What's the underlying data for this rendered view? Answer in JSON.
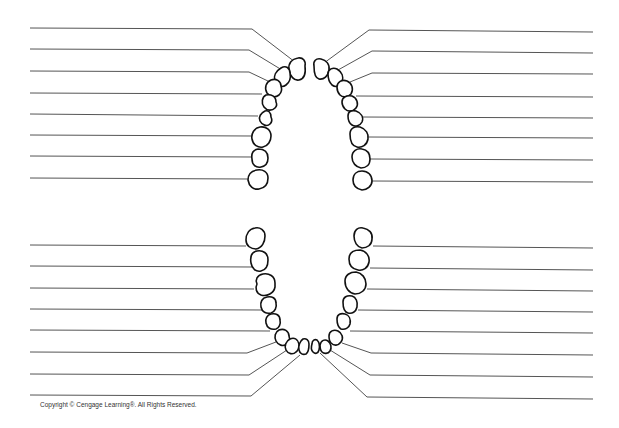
{
  "diagram": {
    "copyright": "Copyright © Cengage Learning®. All Rights Reserved.",
    "colors": {
      "line": "#555555",
      "tooth_outline": "#111111",
      "background": "#ffffff"
    },
    "upper_arch": {
      "left_labels": [
        "",
        "",
        "",
        "",
        "",
        "",
        "",
        ""
      ],
      "right_labels": [
        "",
        "",
        "",
        "",
        "",
        "",
        "",
        ""
      ]
    },
    "lower_arch": {
      "left_labels": [
        "",
        "",
        "",
        "",
        "",
        "",
        "",
        ""
      ],
      "right_labels": [
        "",
        "",
        "",
        "",
        "",
        "",
        "",
        ""
      ]
    }
  }
}
